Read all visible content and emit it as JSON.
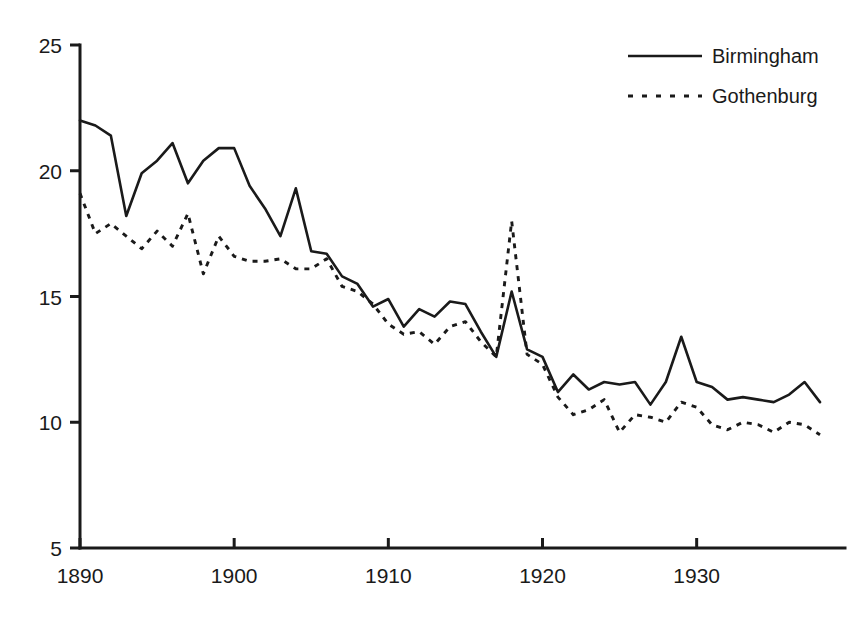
{
  "chart_data": {
    "type": "line",
    "title": "",
    "subtitle": "",
    "xlabel": "",
    "ylabel": "",
    "xlim": [
      1890,
      1938
    ],
    "ylim": [
      5,
      25
    ],
    "grid": false,
    "legend_position": "top-right",
    "x_ticks": [
      "1890",
      "1900",
      "1910",
      "1920",
      "1930"
    ],
    "x_tick_values": [
      1890,
      1900,
      1910,
      1920,
      1930
    ],
    "y_ticks": [
      "5",
      "10",
      "15",
      "20",
      "25"
    ],
    "y_tick_values": [
      5,
      10,
      15,
      20,
      25
    ],
    "x": [
      1890,
      1891,
      1892,
      1893,
      1894,
      1895,
      1896,
      1897,
      1898,
      1899,
      1900,
      1901,
      1902,
      1903,
      1904,
      1905,
      1906,
      1907,
      1908,
      1909,
      1910,
      1911,
      1912,
      1913,
      1914,
      1915,
      1916,
      1917,
      1918,
      1919,
      1920,
      1921,
      1922,
      1923,
      1924,
      1925,
      1926,
      1927,
      1928,
      1929,
      1930,
      1931,
      1932,
      1933,
      1934,
      1935,
      1936,
      1937,
      1938
    ],
    "series": [
      {
        "name": "Birmingham",
        "style": "solid",
        "color": "#1a1a1a",
        "values": [
          22.0,
          21.8,
          21.4,
          18.2,
          19.9,
          20.4,
          21.1,
          19.5,
          20.4,
          20.9,
          20.9,
          19.4,
          18.5,
          17.4,
          19.3,
          16.8,
          16.7,
          15.8,
          15.5,
          14.6,
          14.9,
          13.8,
          14.5,
          14.2,
          14.8,
          14.7,
          13.6,
          12.6,
          15.2,
          12.9,
          12.6,
          11.2,
          11.9,
          11.3,
          11.6,
          11.5,
          11.6,
          10.7,
          11.6,
          13.4,
          11.6,
          11.4,
          10.9,
          11.0,
          10.9,
          10.8,
          11.1,
          11.6,
          10.8
        ]
      },
      {
        "name": "Gothenburg",
        "style": "dotted",
        "color": "#1a1a1a",
        "values": [
          19.1,
          17.5,
          17.9,
          17.4,
          16.9,
          17.6,
          17.0,
          18.3,
          15.9,
          17.4,
          16.6,
          16.4,
          16.4,
          16.5,
          16.1,
          16.1,
          16.5,
          15.4,
          15.2,
          14.7,
          13.9,
          13.5,
          13.6,
          13.1,
          13.8,
          14.0,
          13.2,
          12.6,
          18.0,
          12.7,
          12.3,
          11.0,
          10.3,
          10.5,
          10.9,
          9.6,
          10.3,
          10.2,
          10.0,
          10.8,
          10.6,
          9.9,
          9.7,
          10.0,
          9.9,
          9.6,
          10.0,
          9.9,
          9.5
        ]
      }
    ]
  },
  "legend": {
    "items": [
      {
        "label": "Birmingham",
        "style": "solid"
      },
      {
        "label": "Gothenburg",
        "style": "dotted"
      }
    ]
  }
}
